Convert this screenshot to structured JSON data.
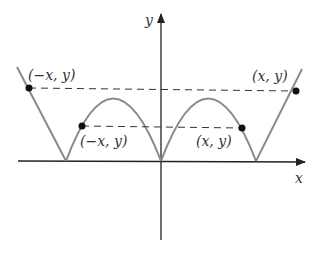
{
  "diagram": {
    "axes": {
      "x_label": "x",
      "y_label": "y"
    },
    "colors": {
      "axis": "#222222",
      "curve": "#8a8a8a",
      "dashed": "#333333",
      "point": "#111111"
    },
    "points": [
      {
        "label": "(−x, y)",
        "position": "upper-left"
      },
      {
        "label": "(x, y)",
        "position": "upper-right"
      },
      {
        "label": "(−x, y)",
        "position": "lower-left"
      },
      {
        "label": "(x, y)",
        "position": "lower-right"
      }
    ]
  }
}
